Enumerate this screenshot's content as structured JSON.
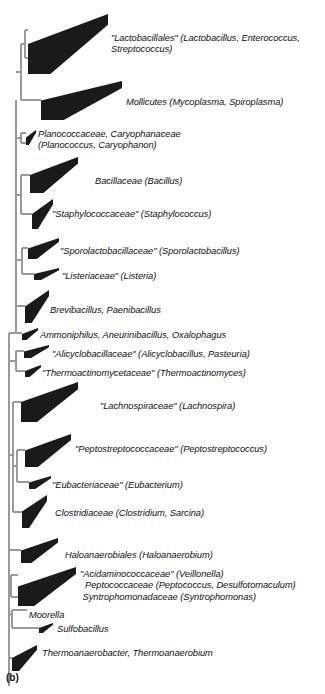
{
  "figure": {
    "panel_label": "(b)",
    "type": "phylogenetic-tree",
    "colors": {
      "wedge_fill": "#1a1a1a",
      "branch_line": "#9a9a9a",
      "text": "#111111",
      "background": "#ffffff"
    }
  },
  "taxa": [
    {
      "id": "lactobacillales",
      "lines": [
        "\"Lactobacillales\" (Lactobacillus, Enterococcus,",
        "Streptococcus)"
      ],
      "label_x": 111,
      "label_y": 33,
      "wedge": {
        "x": 28,
        "y": 14,
        "w": 80,
        "h": 60
      }
    },
    {
      "id": "mollicutes",
      "lines": [
        "Mollicutes (Mycoplasma, Spiroplasma)"
      ],
      "label_x": 126,
      "label_y": 97,
      "wedge": {
        "x": 41,
        "y": 81,
        "w": 81,
        "h": 39
      }
    },
    {
      "id": "planococcaceae",
      "lines": [
        "Planococcaceae, Caryophanaceae",
        "(Planococcus, Caryophanon)"
      ],
      "label_x": 38,
      "label_y": 129,
      "wedge": {
        "x": 26,
        "y": 130,
        "w": 10,
        "h": 15
      }
    },
    {
      "id": "bacillaceae",
      "lines": [
        "Bacillaceae (Bacillus)"
      ],
      "label_x": 95,
      "label_y": 176,
      "wedge": {
        "x": 30,
        "y": 157,
        "w": 48,
        "h": 36
      }
    },
    {
      "id": "staphylococcaceae",
      "lines": [
        "\"Staphylococcaceae\" (Staphylococcus)"
      ],
      "label_x": 52,
      "label_y": 209,
      "wedge": {
        "x": 32,
        "y": 199,
        "w": 21,
        "h": 30
      }
    },
    {
      "id": "sporolactobacillaceae",
      "lines": [
        "\"Sporolactobacillaceae\" (Sporolactobacillus)"
      ],
      "label_x": 60,
      "label_y": 246,
      "wedge": {
        "x": 28,
        "y": 238,
        "w": 31,
        "h": 21
      }
    },
    {
      "id": "listeriaceae",
      "lines": [
        "\"Listeriaceae\" (Listeria)"
      ],
      "label_x": 62,
      "label_y": 271,
      "wedge": {
        "x": 34,
        "y": 268,
        "w": 25,
        "h": 12
      }
    },
    {
      "id": "brevibacillus",
      "lines": [
        "Brevibacillus, Paenibacillus"
      ],
      "label_x": 50,
      "label_y": 305,
      "wedge": {
        "x": 25,
        "y": 290,
        "w": 24,
        "h": 33
      }
    },
    {
      "id": "ammoniphilus",
      "lines": [
        "Ammoniphilus, Aneurinibacillus, Oxalophagus"
      ],
      "label_x": 40,
      "label_y": 330,
      "wedge": {
        "x": 22,
        "y": 328,
        "w": 16,
        "h": 12
      }
    },
    {
      "id": "alicyclobacillaceae",
      "lines": [
        "\"Alicyclobacillaceae\" (Alicyclobacillus, Pasteuria)"
      ],
      "label_x": 52,
      "label_y": 349,
      "wedge": {
        "x": 24,
        "y": 345,
        "w": 25,
        "h": 13
      }
    },
    {
      "id": "thermoactinomycetaceae",
      "lines": [
        "\"Thermoactinomycetaceae\" (Thermoactinomyces)"
      ],
      "label_x": 42,
      "label_y": 368,
      "wedge": {
        "x": 25,
        "y": 365,
        "w": 16,
        "h": 12
      }
    },
    {
      "id": "lachnospiraceae",
      "lines": [
        "\"Lachnospiraceae\" (Lachnospira)"
      ],
      "label_x": 100,
      "label_y": 401,
      "wedge": {
        "x": 21,
        "y": 382,
        "w": 57,
        "h": 40
      }
    },
    {
      "id": "peptostreptococcaceae",
      "lines": [
        "\"Peptostreptococcaceae\" (Peptostreptococcus)"
      ],
      "label_x": 75,
      "label_y": 444,
      "wedge": {
        "x": 25,
        "y": 434,
        "w": 46,
        "h": 33
      }
    },
    {
      "id": "eubacteriaceae",
      "lines": [
        "\"Eubacteriaceae\" (Eubacterium)"
      ],
      "label_x": 52,
      "label_y": 480,
      "wedge": {
        "x": 29,
        "y": 476,
        "w": 22,
        "h": 13
      }
    },
    {
      "id": "clostridiaceae",
      "lines": [
        "Clostridiaceae (Clostridium, Sarcina)"
      ],
      "label_x": 55,
      "label_y": 508,
      "wedge": {
        "x": 22,
        "y": 495,
        "w": 25,
        "h": 33
      }
    },
    {
      "id": "haloanaerobiales",
      "lines": [
        "Haloanaerobiales (Haloanaerobium)"
      ],
      "label_x": 65,
      "label_y": 550,
      "wedge": {
        "x": 21,
        "y": 538,
        "w": 37,
        "h": 25
      }
    },
    {
      "id": "acidaminococcaceae-group",
      "lines": [
        "\"Acidaminococcaceae\" (Veillonella)",
        "  Peptococcaceae (Peptococcus, Desulfotomaculum)",
        " Syntrophomonadaceae (Syntrophomonas)"
      ],
      "label_x": 80,
      "label_y": 569,
      "wedge": {
        "x": 18,
        "y": 567,
        "w": 58,
        "h": 39
      }
    },
    {
      "id": "moorella",
      "lines": [
        "Moorella"
      ],
      "label_x": 29,
      "label_y": 610,
      "wedge": null
    },
    {
      "id": "sulfobacillus",
      "lines": [
        "Sulfobacillus"
      ],
      "label_x": 57,
      "label_y": 624,
      "wedge": {
        "x": 39,
        "y": 623,
        "w": 14,
        "h": 10
      }
    },
    {
      "id": "thermoanaerobacter",
      "lines": [
        "Thermoanaerobacter, Thermoanaerobium"
      ],
      "label_x": 42,
      "label_y": 648,
      "wedge": {
        "x": 12,
        "y": 645,
        "w": 25,
        "h": 26
      }
    }
  ],
  "branches": {
    "description": "Light-gray cladogram lines connecting wedge apices to the common root spine on the left.",
    "vertical_spines": [
      {
        "id": "root-spine",
        "x": 9,
        "y1": 340,
        "y2": 686
      },
      {
        "id": "bacilli-spine",
        "x": 16,
        "y1": 100,
        "y2": 333
      },
      {
        "id": "lacto-moll-node",
        "x": 21,
        "y1": 44,
        "y2": 100
      },
      {
        "id": "lacto-inner-node",
        "x": 25,
        "y1": 30,
        "y2": 58
      },
      {
        "id": "planococcus-node",
        "x": 21,
        "y1": 133,
        "y2": 143
      },
      {
        "id": "bacillaceae-staph-node",
        "x": 21,
        "y1": 175,
        "y2": 214
      },
      {
        "id": "sporo-listeria-node",
        "x": 22,
        "y1": 248,
        "y2": 274
      },
      {
        "id": "alicyclo-thermo-node",
        "x": 16,
        "y1": 351,
        "y2": 371
      },
      {
        "id": "clostridia-node",
        "x": 13,
        "y1": 402,
        "y2": 512
      },
      {
        "id": "pepto-eubact-node",
        "x": 17,
        "y1": 450,
        "y2": 482
      },
      {
        "id": "acidamino-node",
        "x": 11,
        "y1": 575,
        "y2": 597
      },
      {
        "id": "moorella-sulfo-node",
        "x": 12,
        "y1": 610,
        "y2": 628
      }
    ]
  }
}
